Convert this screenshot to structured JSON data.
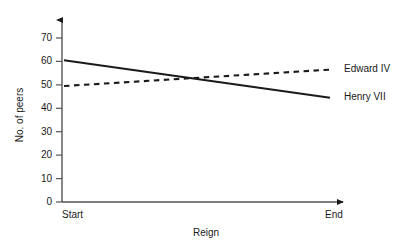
{
  "chart_data": {
    "type": "line",
    "title": "",
    "xlabel": "Reign",
    "ylabel": "No. of peers",
    "x": [
      "Start",
      "End"
    ],
    "categories": [
      "Start",
      "End"
    ],
    "xtick_labels": [
      "Start",
      "End"
    ],
    "ytick_labels": [
      "0",
      "10",
      "20",
      "30",
      "40",
      "50",
      "60",
      "70"
    ],
    "yticks": [
      0,
      10,
      20,
      30,
      40,
      50,
      60,
      70
    ],
    "ylim": [
      0,
      78
    ],
    "grid": false,
    "legend_position": "right-of-line-ends",
    "series": [
      {
        "name": "Edward IV",
        "style": "dashed",
        "color": "#1a1a1a",
        "values": [
          49.5,
          56.5
        ]
      },
      {
        "name": "Henry VII",
        "style": "solid",
        "color": "#1a1a1a",
        "values": [
          60.5,
          44.5
        ]
      }
    ],
    "annotations": []
  },
  "axes": {
    "y_title": "No. of peers",
    "x_title": "Reign",
    "x_start_label": "Start",
    "x_end_label": "End",
    "arrowheads": "both"
  },
  "legend": {
    "edward_label": "Edward IV",
    "henry_label": "Henry VII"
  },
  "ticks": {
    "y0": "0",
    "y10": "10",
    "y20": "20",
    "y30": "30",
    "y40": "40",
    "y50": "50",
    "y60": "60",
    "y70": "70"
  },
  "colors": {
    "ink": "#1a1a1a",
    "background": "#ffffff"
  }
}
